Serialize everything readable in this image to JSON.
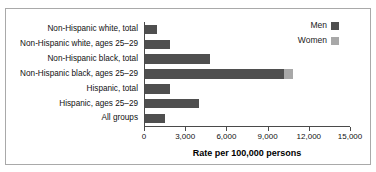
{
  "chart_data": {
    "type": "bar",
    "orientation": "horizontal",
    "title": "",
    "subtitle": "",
    "xlabel": "Rate per 100,000 persons",
    "ylabel": "",
    "xlim": [
      0,
      15000
    ],
    "xticks": [
      0,
      3000,
      6000,
      9000,
      12000,
      15000
    ],
    "xtick_labels": [
      "0",
      "3,000",
      "6,000",
      "9,000",
      "12,000",
      "15,000"
    ],
    "grid": false,
    "stacked": true,
    "legend_position": "top-right",
    "categories": [
      "Non-Hispanic white, total",
      "Non-Hispanic white, ages 25–29",
      "Non-Hispanic black, total",
      "Non-Hispanic black, ages 25–29",
      "Hispanic, total",
      "Hispanic, ages 25–29",
      "All groups"
    ],
    "series": [
      {
        "name": "Men",
        "color": "#4f4f4f",
        "values": [
          880,
          1830,
          4760,
          10150,
          1830,
          3930,
          1440
        ]
      },
      {
        "name": "Women",
        "color": "#a8a8a8",
        "values": [
          0,
          0,
          0,
          610,
          0,
          0,
          0
        ]
      }
    ]
  },
  "legend": {
    "entries": [
      {
        "label": "Men",
        "color": "#4f4f4f"
      },
      {
        "label": "Women",
        "color": "#a8a8a8"
      }
    ]
  },
  "colors": {
    "men": "#4f4f4f",
    "women": "#a8a8a8",
    "axis": "#4a4a4a",
    "frame": "#a9a9a9",
    "background": "#ffffff"
  }
}
